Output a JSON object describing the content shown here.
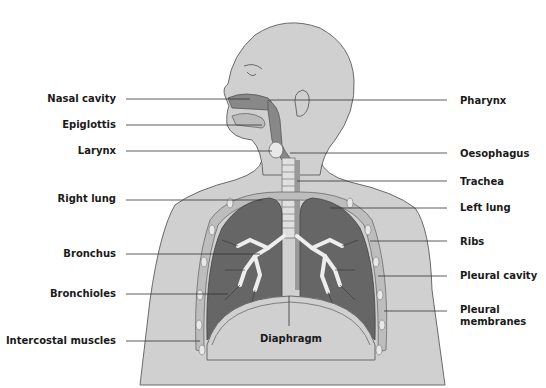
{
  "diagram": {
    "colors": {
      "body": "#d0d0d0",
      "body_outline": "#6a6a6a",
      "lung": "#666666",
      "airway": "#a8a8a8",
      "bronchi": "#eeeeee",
      "leader_line": "#333333",
      "label_text": "#1a1a1a"
    },
    "labels_left": [
      {
        "id": "nasal-cavity",
        "text": "Nasal cavity"
      },
      {
        "id": "epiglottis",
        "text": "Epiglottis"
      },
      {
        "id": "larynx",
        "text": "Larynx"
      },
      {
        "id": "right-lung",
        "text": "Right lung"
      },
      {
        "id": "bronchus",
        "text": "Bronchus"
      },
      {
        "id": "bronchioles",
        "text": "Bronchioles"
      },
      {
        "id": "intercostal-muscles",
        "text": "Intercostal muscles"
      }
    ],
    "labels_right": [
      {
        "id": "pharynx",
        "text": "Pharynx"
      },
      {
        "id": "oesophagus",
        "text": "Oesophagus"
      },
      {
        "id": "trachea",
        "text": "Trachea"
      },
      {
        "id": "left-lung",
        "text": "Left lung"
      },
      {
        "id": "ribs",
        "text": "Ribs"
      },
      {
        "id": "pleural-cavity",
        "text": "Pleural cavity"
      },
      {
        "id": "pleural-membranes",
        "text": "Pleural\nmembranes"
      }
    ],
    "labels_center": [
      {
        "id": "diaphragm",
        "text": "Diaphragm"
      }
    ]
  }
}
